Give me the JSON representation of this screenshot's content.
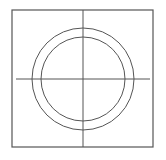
{
  "diagram": {
    "canvas": {
      "width": 166,
      "height": 160,
      "background": "#ffffff"
    },
    "stroke_color": "#555555",
    "frame": {
      "x": 12,
      "y": 10,
      "width": 141,
      "height": 137
    },
    "center": {
      "x": 83,
      "y": 79
    },
    "outer_circle": {
      "r": 51
    },
    "inner_circle": {
      "r": 42
    },
    "horizontal_axis": {
      "x1": 16,
      "x2": 150,
      "y": 79
    },
    "vertical_axis": {
      "x": 83,
      "y1": 10,
      "y2": 147
    }
  }
}
